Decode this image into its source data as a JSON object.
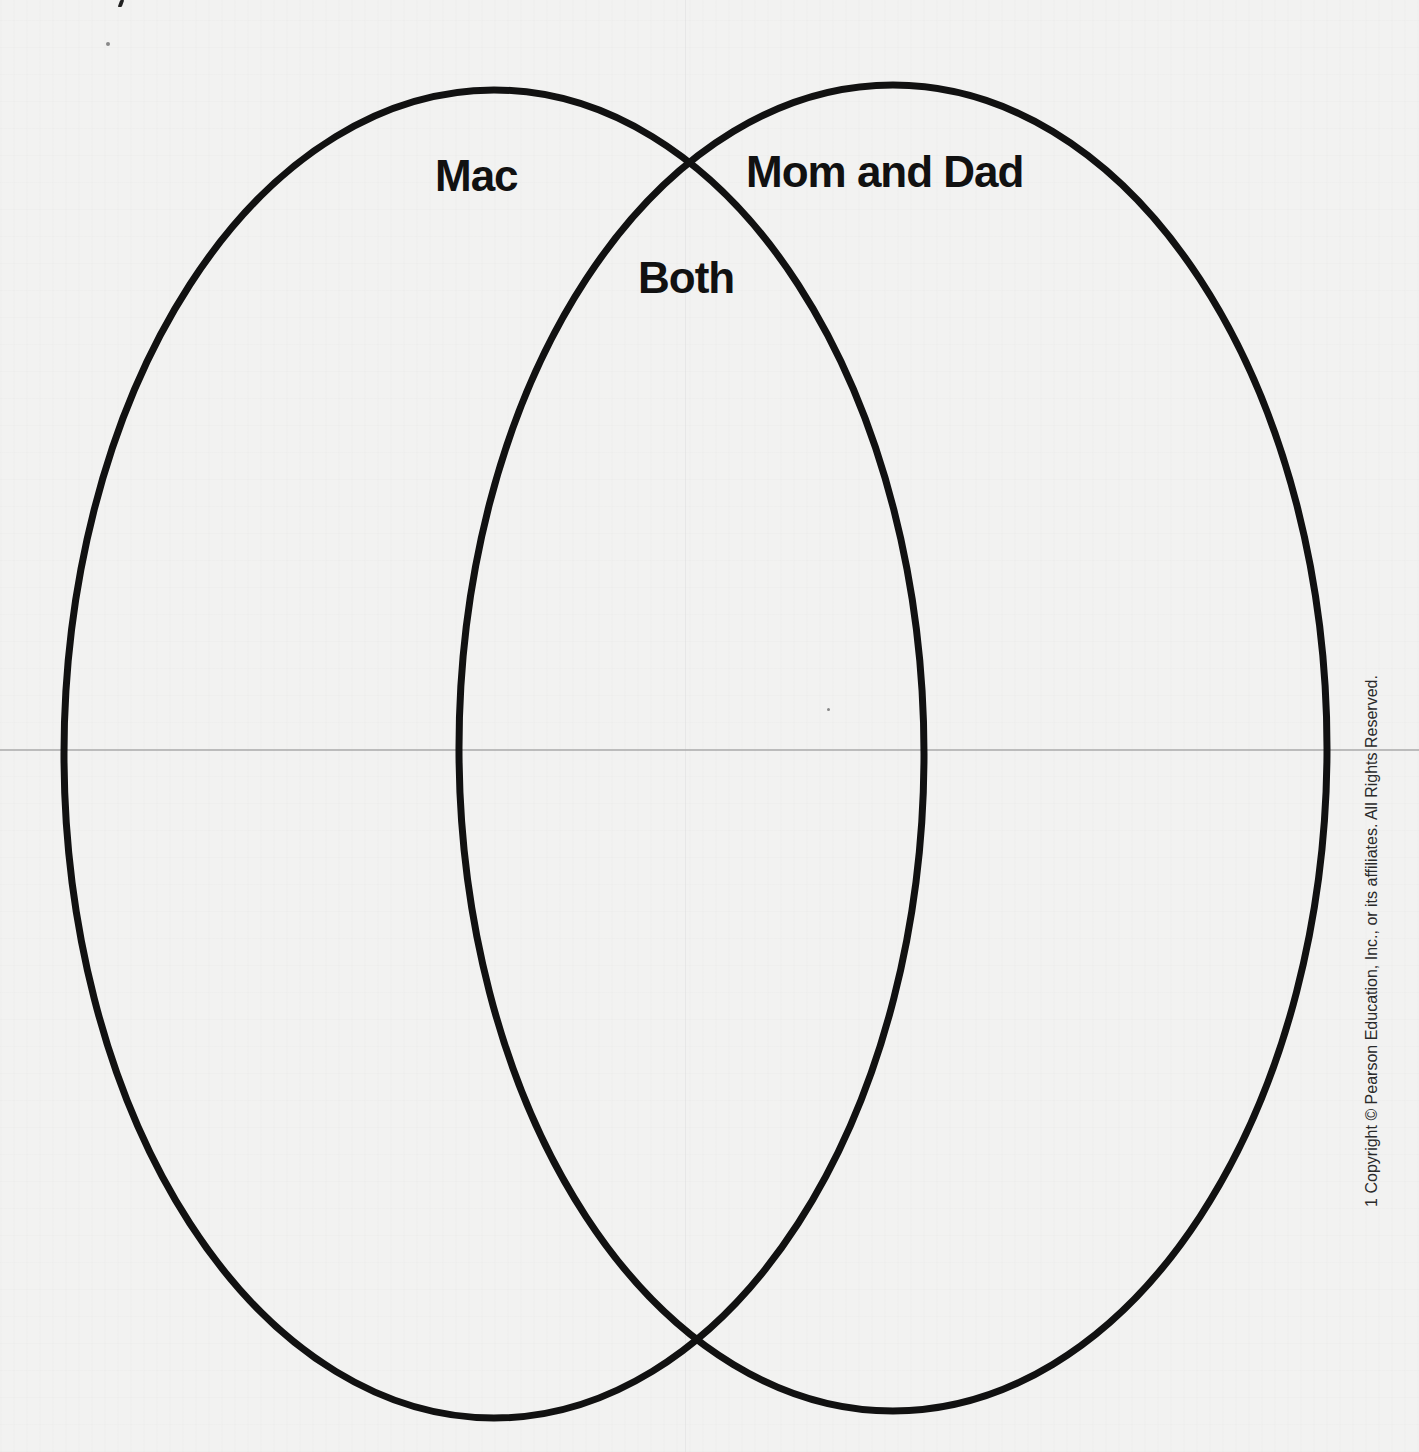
{
  "diagram": {
    "type": "venn",
    "sets": [
      {
        "id": "left",
        "label": "Mac",
        "ellipse": {
          "cx": 494,
          "cy": 754,
          "rx": 430,
          "ry": 664
        }
      },
      {
        "id": "right",
        "label": "Mom and Dad",
        "ellipse": {
          "cx": 893,
          "cy": 748,
          "rx": 434,
          "ry": 663
        }
      }
    ],
    "intersection_label": "Both",
    "stroke_color": "#111111",
    "stroke_width": 7
  },
  "labels": {
    "left": "Mac",
    "both": "Both",
    "right": "Mom and Dad"
  },
  "footer": {
    "copyright": "1 Copyright © Pearson Education, Inc., or its affiliates. All Rights Reserved."
  },
  "colors": {
    "background": "#f2f2f1",
    "ink": "#111111",
    "fold_line": "#a9a9a9"
  }
}
